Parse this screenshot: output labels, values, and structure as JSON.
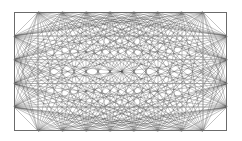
{
  "figure": {
    "type": "geometric-line-art",
    "canvas": {
      "width": 242,
      "height": 141,
      "background": "#ffffff"
    },
    "frame": {
      "x": 14,
      "y": 12,
      "width": 213,
      "height": 119,
      "stroke": "#6b6b6b",
      "stroke_width": 1,
      "fill": "#ffffff"
    },
    "inner_guides": {
      "description": "Faint axis-aligned guide lines joining opposite perimeter nodes",
      "stroke": "#9a9a9a",
      "stroke_width": 0.6,
      "vertical_x": [
        38,
        203
      ],
      "horizontal_y": [
        36,
        59.75,
        83.5,
        107
      ]
    },
    "nodes": {
      "per_top_edge": 8,
      "per_bottom_edge": 8,
      "per_left_edge": 4,
      "per_right_edge": 4,
      "total": 24,
      "top_y": 12,
      "bottom_y": 131,
      "left_x": 14,
      "right_x": 227,
      "top_x": [
        38,
        62,
        86,
        110,
        134,
        158,
        182,
        203
      ],
      "bottom_x": [
        38,
        62,
        86,
        110,
        134,
        158,
        182,
        203
      ],
      "left_y": [
        36,
        59.75,
        83.5,
        107
      ],
      "right_y": [
        36,
        59.75,
        83.5,
        107
      ]
    },
    "chords": {
      "description": "Every perimeter node is joined by straight lines to the nodes on the opposite edges, producing a dense moire star",
      "stroke": "#3a3a3a",
      "stroke_width": 0.35,
      "opacity": 0.85,
      "convergence_points": 24
    },
    "colors": {
      "background": "#ffffff",
      "frame_stroke": "#6b6b6b",
      "guide_stroke": "#9a9a9a",
      "chord_stroke": "#3a3a3a"
    }
  }
}
